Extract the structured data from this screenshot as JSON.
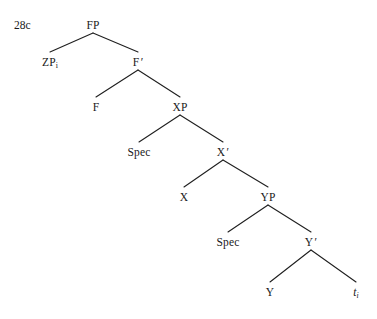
{
  "figure": {
    "example_number": "28c",
    "diagram_type": "syntactic-tree",
    "notation": "x-bar"
  },
  "nodes": [
    {
      "id": "fp",
      "label": "FP",
      "subscript": "",
      "prime": false,
      "italic": false,
      "x": 93,
      "y": 20
    },
    {
      "id": "zp",
      "label": "ZP",
      "subscript": "i",
      "prime": false,
      "italic": false,
      "x": 50,
      "y": 57
    },
    {
      "id": "fbar",
      "label": "F",
      "subscript": "",
      "prime": true,
      "italic": false,
      "x": 138,
      "y": 57
    },
    {
      "id": "f",
      "label": "F",
      "subscript": "",
      "prime": false,
      "italic": false,
      "x": 96,
      "y": 102
    },
    {
      "id": "xp",
      "label": "XP",
      "subscript": "",
      "prime": false,
      "italic": false,
      "x": 180,
      "y": 102
    },
    {
      "id": "spec-x",
      "label": "Spec",
      "subscript": "",
      "prime": false,
      "italic": false,
      "x": 139,
      "y": 147
    },
    {
      "id": "xbar",
      "label": "X",
      "subscript": "",
      "prime": true,
      "italic": false,
      "x": 223,
      "y": 147
    },
    {
      "id": "x",
      "label": "X",
      "subscript": "",
      "prime": false,
      "italic": false,
      "x": 184,
      "y": 192
    },
    {
      "id": "yp",
      "label": "YP",
      "subscript": "",
      "prime": false,
      "italic": false,
      "x": 268,
      "y": 192
    },
    {
      "id": "spec-y",
      "label": "Spec",
      "subscript": "",
      "prime": false,
      "italic": false,
      "x": 228,
      "y": 237
    },
    {
      "id": "ybar",
      "label": "Y",
      "subscript": "",
      "prime": true,
      "italic": false,
      "x": 311,
      "y": 237
    },
    {
      "id": "y",
      "label": "Y",
      "subscript": "",
      "prime": false,
      "italic": false,
      "x": 270,
      "y": 287
    },
    {
      "id": "trace",
      "label": "t",
      "subscript": "i",
      "prime": false,
      "italic": true,
      "x": 356,
      "y": 287
    }
  ],
  "branches": [
    {
      "id": "fp-zp",
      "parent": "FP",
      "child": "ZPi",
      "x1": 93,
      "y1": 33,
      "x2": 50,
      "y2": 52
    },
    {
      "id": "fp-fbar",
      "parent": "FP",
      "child": "F'",
      "x1": 93,
      "y1": 33,
      "x2": 138,
      "y2": 52
    },
    {
      "id": "fbar-f",
      "parent": "F'",
      "child": "F",
      "x1": 138,
      "y1": 70,
      "x2": 96,
      "y2": 97
    },
    {
      "id": "fbar-xp",
      "parent": "F'",
      "child": "XP",
      "x1": 138,
      "y1": 70,
      "x2": 180,
      "y2": 97
    },
    {
      "id": "xp-spec",
      "parent": "XP",
      "child": "Spec",
      "x1": 180,
      "y1": 115,
      "x2": 139,
      "y2": 142
    },
    {
      "id": "xp-xbar",
      "parent": "XP",
      "child": "X'",
      "x1": 180,
      "y1": 115,
      "x2": 223,
      "y2": 142
    },
    {
      "id": "xbar-x",
      "parent": "X'",
      "child": "X",
      "x1": 223,
      "y1": 160,
      "x2": 184,
      "y2": 187
    },
    {
      "id": "xbar-yp",
      "parent": "X'",
      "child": "YP",
      "x1": 223,
      "y1": 160,
      "x2": 268,
      "y2": 187
    },
    {
      "id": "yp-spec",
      "parent": "YP",
      "child": "Spec",
      "x1": 268,
      "y1": 205,
      "x2": 228,
      "y2": 232
    },
    {
      "id": "yp-ybar",
      "parent": "YP",
      "child": "Y'",
      "x1": 268,
      "y1": 205,
      "x2": 311,
      "y2": 232
    },
    {
      "id": "ybar-y",
      "parent": "Y'",
      "child": "Y",
      "x1": 311,
      "y1": 250,
      "x2": 270,
      "y2": 282
    },
    {
      "id": "ybar-trace",
      "parent": "Y'",
      "child": "ti",
      "x1": 311,
      "y1": 250,
      "x2": 356,
      "y2": 282
    }
  ]
}
